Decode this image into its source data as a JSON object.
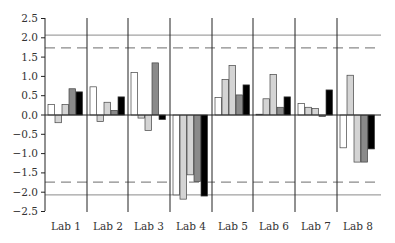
{
  "chart_data": {
    "type": "bar",
    "title": "",
    "xlabel": "",
    "ylabel": "",
    "ylim": [
      -2.5,
      2.5
    ],
    "yticks": [
      "2.5",
      "2.0",
      "1.5",
      "1.0",
      "0.5",
      "0.0",
      "−0.5",
      "−1.0",
      "−1.5",
      "−2.0",
      "−2.5"
    ],
    "ytick_values": [
      2.5,
      2.0,
      1.5,
      1.0,
      0.5,
      0.0,
      -0.5,
      -1.0,
      -1.5,
      -2.0,
      -2.5
    ],
    "categories": [
      "Lab 1",
      "Lab 2",
      "Lab 3",
      "Lab 4",
      "Lab 5",
      "Lab 6",
      "Lab 7",
      "Lab 8"
    ],
    "series": [
      {
        "name": "Series 1",
        "color": "#ffffff",
        "values": [
          0.27,
          0.73,
          1.1,
          -2.07,
          0.45,
          0.02,
          0.3,
          -0.85
        ]
      },
      {
        "name": "Series 2",
        "color": "#d4d4d4",
        "values": [
          -0.2,
          -0.17,
          -0.08,
          -2.18,
          0.92,
          0.42,
          0.2,
          1.03
        ]
      },
      {
        "name": "Series 3",
        "color": "#d4d4d4",
        "values": [
          0.27,
          0.33,
          -0.4,
          -1.55,
          1.28,
          1.05,
          0.17,
          -1.22
        ]
      },
      {
        "name": "Series 4",
        "color": "#8a8a8a",
        "values": [
          0.68,
          0.12,
          1.35,
          -1.72,
          0.52,
          0.2,
          -0.04,
          -1.22
        ]
      },
      {
        "name": "Series 5",
        "color": "#000000",
        "values": [
          0.6,
          0.47,
          -0.12,
          -2.1,
          0.78,
          0.47,
          0.65,
          -0.88
        ]
      }
    ],
    "reference_lines": [
      {
        "value": 2.07,
        "style": "solid",
        "color": "#8a8a8a"
      },
      {
        "value": 1.74,
        "style": "dashed",
        "color": "#8a8a8a"
      },
      {
        "value": -1.74,
        "style": "dashed",
        "color": "#8a8a8a"
      },
      {
        "value": -2.07,
        "style": "solid",
        "color": "#8a8a8a"
      }
    ],
    "grid": false,
    "legend": "none"
  }
}
